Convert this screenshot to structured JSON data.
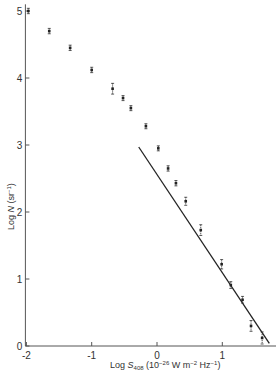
{
  "chart_data": {
    "type": "scatter",
    "title": "",
    "xlabel": "Log S408 (10^-26 W m^-2 Hz^-1)",
    "ylabel": "Log N (sr^-1)",
    "xlabel_parts": {
      "pre": "Log ",
      "sym": "S",
      "sub": "408",
      "unit_pre": "(10",
      "unit_exp": "−26",
      "unit_mid": " W m",
      "unit_exp2": "−2",
      "unit_mid2": " Hz",
      "unit_exp3": "−1",
      "unit_post": ")"
    },
    "ylabel_parts": {
      "pre": "Log ",
      "sym": "N",
      "unit_pre": " (sr",
      "unit_exp": "−1",
      "unit_post": ")"
    },
    "xlim": [
      -2.0,
      1.8
    ],
    "ylim": [
      0,
      5.2
    ],
    "xticks": [
      -2,
      -1,
      0,
      1
    ],
    "yticks": [
      0,
      1,
      2,
      3,
      4,
      5
    ],
    "grid": false,
    "legend": null,
    "series": [
      {
        "name": "source counts",
        "marker": "errorbar-point",
        "points": [
          {
            "x": -1.97,
            "y": 5.0,
            "err": 0.04
          },
          {
            "x": -1.65,
            "y": 4.7,
            "err": 0.04
          },
          {
            "x": -1.33,
            "y": 4.45,
            "err": 0.04
          },
          {
            "x": -1.0,
            "y": 4.12,
            "err": 0.04
          },
          {
            "x": -0.68,
            "y": 3.84,
            "err": 0.08
          },
          {
            "x": -0.52,
            "y": 3.7,
            "err": 0.03
          },
          {
            "x": -0.4,
            "y": 3.55,
            "err": 0.03
          },
          {
            "x": -0.17,
            "y": 3.28,
            "err": 0.03
          },
          {
            "x": 0.02,
            "y": 2.95,
            "err": 0.03
          },
          {
            "x": 0.17,
            "y": 2.65,
            "err": 0.04
          },
          {
            "x": 0.29,
            "y": 2.43,
            "err": 0.04
          },
          {
            "x": 0.44,
            "y": 2.16,
            "err": 0.06
          },
          {
            "x": 0.67,
            "y": 1.73,
            "err": 0.08
          },
          {
            "x": 0.99,
            "y": 1.22,
            "err": 0.07
          },
          {
            "x": 1.13,
            "y": 0.91,
            "err": 0.05
          },
          {
            "x": 1.31,
            "y": 0.69,
            "err": 0.05
          },
          {
            "x": 1.44,
            "y": 0.3,
            "err": 0.08
          },
          {
            "x": 1.61,
            "y": 0.12,
            "err": 0.09
          }
        ]
      },
      {
        "name": "Euclidean slope -1.5 line",
        "type": "line",
        "points": [
          {
            "x": -0.28,
            "y": 2.97
          },
          {
            "x": 1.72,
            "y": 0.04
          }
        ]
      }
    ]
  }
}
